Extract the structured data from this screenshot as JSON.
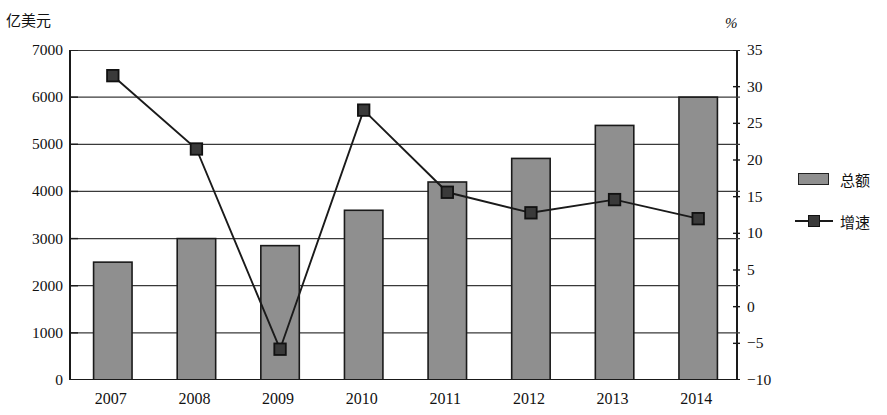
{
  "chart_data": {
    "type": "bar",
    "title": "",
    "categories": [
      "2007",
      "2008",
      "2009",
      "2010",
      "2011",
      "2012",
      "2013",
      "2014"
    ],
    "series": [
      {
        "name": "总额",
        "type": "bar",
        "axis": "left",
        "unit": "亿美元",
        "values": [
          2500,
          3000,
          2850,
          3600,
          4200,
          4700,
          5400,
          6000
        ]
      },
      {
        "name": "增速",
        "type": "line",
        "axis": "right",
        "unit": "%",
        "values": [
          31.5,
          21.5,
          -5.8,
          26.8,
          15.6,
          12.8,
          14.6,
          12.0
        ]
      }
    ],
    "xlabel": "",
    "ylabel": "亿美元",
    "y2label": "%",
    "ylim": [
      0,
      7000
    ],
    "y2lim": [
      -10,
      35
    ],
    "yticks": [
      "7000",
      "6000",
      "5000",
      "4000",
      "3000",
      "2000",
      "1000",
      "0"
    ],
    "ytick_values": [
      7000,
      6000,
      5000,
      4000,
      3000,
      2000,
      1000,
      0
    ],
    "y2ticks": [
      "35",
      "30",
      "25",
      "20",
      "15",
      "10",
      "5",
      "0",
      "−5",
      "−10"
    ],
    "y2tick_values": [
      35,
      30,
      25,
      20,
      15,
      10,
      5,
      0,
      -5,
      -10
    ],
    "grid": true,
    "legend_position": "right",
    "colors": {
      "bar_fill": "#8f8f8f",
      "bar_stroke": "#1a1a1a",
      "line": "#1a1a1a",
      "marker_fill": "#3a3a3a",
      "grid": "#3a3a3a",
      "axis": "#1a1a1a",
      "background": "#ffffff"
    }
  },
  "legend": {
    "items": [
      {
        "label": "总额",
        "symbol": "bar-swatch"
      },
      {
        "label": "增速",
        "symbol": "line-marker-swatch"
      }
    ]
  }
}
